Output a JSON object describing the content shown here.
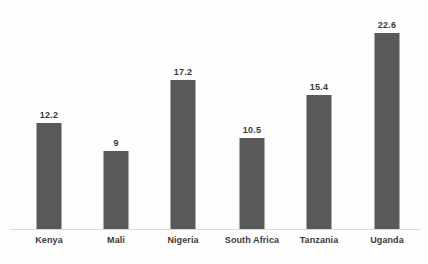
{
  "chart_data": {
    "type": "bar",
    "title": "",
    "subtitle": "",
    "xlabel": "",
    "ylabel": "",
    "categories": [
      "Kenya",
      "Mali",
      "Nigeria",
      "South Africa",
      "Tanzania",
      "Uganda"
    ],
    "values": [
      12.2,
      9,
      17.2,
      10.5,
      15.4,
      22.6
    ],
    "value_labels": [
      "12.2",
      "9",
      "17.2",
      "10.5",
      "15.4",
      "22.6"
    ],
    "ylim": [
      0,
      22.6
    ],
    "grid": false,
    "legend": null,
    "legend_position": "none",
    "series": [
      {
        "name": "",
        "values": [
          12.2,
          9,
          17.2,
          10.5,
          15.4,
          22.6
        ]
      }
    ],
    "colors": {
      "bar_fill": "#595959",
      "axis_line": "#d9d9d9",
      "label_text": "#3b3b3b",
      "background": "#fdfdfd"
    }
  }
}
